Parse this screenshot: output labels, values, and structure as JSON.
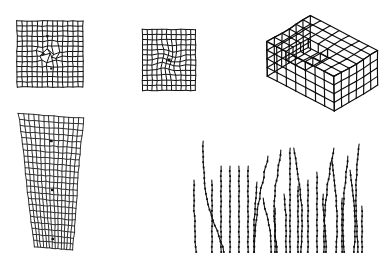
{
  "figure": {
    "title": "",
    "background_color": "#ffffff",
    "ink_color": "#111111",
    "width": 384,
    "height": 267,
    "panel_count": 4
  },
  "panels": [
    {
      "id": "panel-grid-perturbed",
      "name": "square-grid-with-central-perturbation",
      "label": "",
      "type": "2d-structured-quad-mesh",
      "position": {
        "x": 16,
        "y": 20,
        "width": 66,
        "height": 66
      },
      "grid": {
        "columns": 13,
        "rows": 13,
        "cell_size": 5.1
      },
      "distortion": {
        "kind": "irregular-central-patch",
        "center_x": 0.5,
        "center_y": 0.5,
        "radius": 0.26,
        "amplitude": 2.6,
        "seed": 7
      }
    },
    {
      "id": "panel-grid-radial",
      "name": "square-grid-with-radial-distortion",
      "label": "",
      "type": "2d-structured-quad-mesh",
      "position": {
        "x": 141,
        "y": 28,
        "width": 53,
        "height": 61
      },
      "grid": {
        "columns": 11,
        "rows": 12,
        "cell_size": 4.9
      },
      "distortion": {
        "kind": "radial-circular",
        "center_x": 0.5,
        "center_y": 0.5,
        "radius": 0.3,
        "amplitude": 1.9,
        "seed": 3
      },
      "center_marker": {
        "shape": "square",
        "size": 3.0
      }
    },
    {
      "id": "panel-box-3d",
      "name": "isometric-hexahedral-box-mesh-with-notch",
      "label": "",
      "type": "3d-hexahedral-mesh",
      "position": {
        "x": 255,
        "y": 14,
        "width": 105,
        "height": 100
      },
      "grid": {
        "nx": 7,
        "ny": 6,
        "nz": 4
      },
      "projection": "isometric",
      "feature": "rectangular-notch-cut-in-top-face",
      "notch": {
        "i0": 2,
        "i1": 4,
        "j0": 0,
        "j1": 3,
        "depth_layers": 1
      }
    },
    {
      "id": "panel-tapered-mesh",
      "name": "tapered-trapezoidal-mesh",
      "label": "",
      "type": "2d-structured-quad-mesh",
      "position": {
        "x": 16,
        "y": 113,
        "width": 68,
        "height": 138
      },
      "grid": {
        "columns": 13,
        "rows": 22
      },
      "shape": {
        "top_left_x": 0.035,
        "top_right_x": 0.99,
        "bottom_left_x": 0.27,
        "bottom_right_x": 0.83,
        "top_left_y": 0.012,
        "top_right_y": 0.045,
        "bottom_left_y": 0.975,
        "bottom_right_y": 1.0
      },
      "interior_markers": [
        {
          "u": 0.5,
          "v": 0.19
        },
        {
          "u": 0.5,
          "v": 0.56
        },
        {
          "u": 0.49,
          "v": 0.93
        }
      ],
      "distortion": {
        "kind": "mild-wavy-shear",
        "amplitude": 1.4,
        "seed": 11
      }
    },
    {
      "id": "panel-trajectories",
      "name": "beaded-streamline-trajectory-field",
      "label": "",
      "type": "polyline-trajectories-with-nodes",
      "position": {
        "x": 188,
        "y": 138,
        "width": 178,
        "height": 118
      },
      "trajectory_count": 26,
      "node_marker": {
        "shape": "square",
        "size": 1.8,
        "spacing": 5.2
      },
      "baseline_y": 256
    }
  ],
  "chart_data": {
    "type": "line",
    "title": "",
    "xlabel": "",
    "ylabel": "",
    "legend": [],
    "grid": false,
    "trajectories": [
      {
        "id": "t1",
        "x": [
          196,
          196,
          196,
          197,
          197,
          198
        ],
        "y_top": 182,
        "y_bottom": 254,
        "curvature": "straight"
      },
      {
        "id": "t2",
        "x": [
          205,
          205,
          206,
          207,
          210,
          215,
          221,
          226
        ],
        "y_top": 143,
        "y_bottom": 254,
        "curvature": "hook-right-top"
      },
      {
        "id": "t3",
        "x": [
          214,
          214,
          214,
          214,
          214,
          214
        ],
        "y_top": 182,
        "y_bottom": 254,
        "curvature": "straight"
      },
      {
        "id": "t4",
        "x": [
          223,
          223,
          223,
          223,
          223,
          223
        ],
        "y_top": 168,
        "y_bottom": 254,
        "curvature": "straight"
      },
      {
        "id": "t5",
        "x": [
          232,
          232,
          232,
          232,
          232,
          232
        ],
        "y_top": 168,
        "y_bottom": 254,
        "curvature": "straight"
      },
      {
        "id": "t6",
        "x": [
          241,
          241,
          241,
          241,
          241,
          241
        ],
        "y_top": 168,
        "y_bottom": 254,
        "curvature": "straight"
      },
      {
        "id": "t7",
        "x": [
          250,
          250,
          250,
          250,
          250,
          250
        ],
        "y_top": 168,
        "y_bottom": 254,
        "curvature": "straight"
      },
      {
        "id": "t8",
        "x": [
          259,
          258,
          257,
          256,
          256,
          256
        ],
        "y_top": 184,
        "y_bottom": 254,
        "curvature": "slight-left"
      },
      {
        "id": "t9",
        "x": [
          270,
          266,
          262,
          259,
          257,
          256
        ],
        "y_top": 158,
        "y_bottom": 254,
        "curvature": "lean-left"
      },
      {
        "id": "t10",
        "x": [
          265,
          267,
          270,
          272,
          273,
          273
        ],
        "y_top": 200,
        "y_bottom": 254,
        "curvature": "slight-right"
      },
      {
        "id": "t11",
        "x": [
          283,
          280,
          277,
          276,
          277,
          279
        ],
        "y_top": 152,
        "y_bottom": 254,
        "curvature": "s-curve"
      },
      {
        "id": "t12",
        "x": [
          286,
          287,
          288,
          288,
          288,
          288
        ],
        "y_top": 196,
        "y_bottom": 254,
        "curvature": "straight"
      },
      {
        "id": "t13",
        "x": [
          292,
          292,
          292,
          292,
          292,
          292
        ],
        "y_top": 150,
        "y_bottom": 254,
        "curvature": "straight"
      },
      {
        "id": "t14",
        "x": [
          296,
          299,
          302,
          304,
          304,
          303
        ],
        "y_top": 150,
        "y_bottom": 254,
        "curvature": "bow-right"
      },
      {
        "id": "t15",
        "x": [
          300,
          300,
          300,
          300,
          300,
          300
        ],
        "y_top": 188,
        "y_bottom": 254,
        "curvature": "straight"
      },
      {
        "id": "t16",
        "x": [
          310,
          310,
          310,
          310,
          310,
          310
        ],
        "y_top": 182,
        "y_bottom": 254,
        "curvature": "straight"
      },
      {
        "id": "t17",
        "x": [
          319,
          319,
          319,
          319,
          319,
          319
        ],
        "y_top": 174,
        "y_bottom": 254,
        "curvature": "straight"
      },
      {
        "id": "t18",
        "x": [
          325,
          325,
          326,
          327,
          328,
          328
        ],
        "y_top": 196,
        "y_bottom": 254,
        "curvature": "slight-right"
      },
      {
        "id": "t19",
        "x": [
          336,
          332,
          329,
          327,
          326,
          326
        ],
        "y_top": 150,
        "y_bottom": 254,
        "curvature": "lean-left"
      },
      {
        "id": "t20",
        "x": [
          334,
          336,
          338,
          339,
          339,
          338
        ],
        "y_top": 162,
        "y_bottom": 254,
        "curvature": "bow-right"
      },
      {
        "id": "t21",
        "x": [
          344,
          344,
          344,
          344,
          344,
          344
        ],
        "y_top": 200,
        "y_bottom": 254,
        "curvature": "straight"
      },
      {
        "id": "t22",
        "x": [
          350,
          348,
          346,
          345,
          345,
          346
        ],
        "y_top": 158,
        "y_bottom": 254,
        "curvature": "s-curve"
      },
      {
        "id": "t23",
        "x": [
          352,
          354,
          356,
          357,
          357,
          356
        ],
        "y_top": 172,
        "y_bottom": 254,
        "curvature": "bow-right"
      },
      {
        "id": "t24",
        "x": [
          361,
          359,
          358,
          358,
          359,
          360
        ],
        "y_top": 146,
        "y_bottom": 254,
        "curvature": "s-curve"
      },
      {
        "id": "t25",
        "x": [
          364,
          364,
          364,
          364,
          364,
          364
        ],
        "y_top": 208,
        "y_bottom": 254,
        "curvature": "straight"
      },
      {
        "id": "t26",
        "x": [
          277,
          277,
          277,
          277,
          277,
          277
        ],
        "y_top": 210,
        "y_bottom": 254,
        "curvature": "straight"
      }
    ]
  }
}
